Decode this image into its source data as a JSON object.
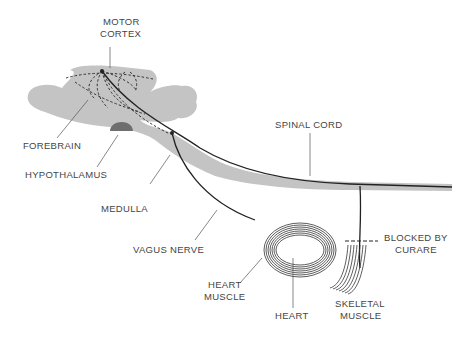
{
  "diagram": {
    "type": "anatomical",
    "labels": {
      "motor_cortex_1": "MOTOR",
      "motor_cortex_2": "CORTEX",
      "forebrain": "FOREBRAIN",
      "hypothalamus": "HYPOTHALAMUS",
      "medulla": "MEDULLA",
      "vagus_nerve": "VAGUS  NERVE",
      "spinal_cord": "SPINAL CORD",
      "heart_muscle_1": "HEART",
      "heart_muscle_2": "MUSCLE",
      "heart": "HEART",
      "blocked_1": "BLOCKED BY",
      "blocked_2": "CURARE",
      "skeletal_1": "SKELETAL",
      "skeletal_2": "MUSCLE"
    },
    "colors": {
      "tissue": "#c4c4c4",
      "hypothalamus": "#6e6e6e",
      "nerve": "#222222",
      "leader": "#555555"
    }
  }
}
